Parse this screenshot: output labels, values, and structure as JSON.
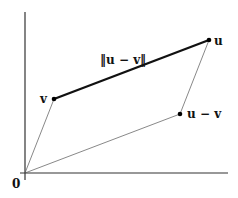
{
  "diagram": {
    "colors": {
      "axis": "#333333",
      "thin_line": "#555555",
      "thick_line": "#111111",
      "point": "#000000"
    },
    "axes": {
      "origin_label": "0"
    },
    "points": [
      {
        "id": "origin",
        "label": "0"
      },
      {
        "id": "u",
        "label": "u"
      },
      {
        "id": "v",
        "label": "v"
      },
      {
        "id": "u_minus_v",
        "label": "u − v"
      }
    ],
    "segments": [
      {
        "from": "origin",
        "to": "v",
        "style": "thin"
      },
      {
        "from": "origin",
        "to": "u_minus_v",
        "style": "thin"
      },
      {
        "from": "u_minus_v",
        "to": "u",
        "style": "thin"
      },
      {
        "from": "v",
        "to": "u",
        "style": "thick",
        "label": "‖u − v‖"
      }
    ],
    "labels": {
      "u": "u",
      "v": "v",
      "u_minus_v": "u − v",
      "norm": "‖u − v‖",
      "origin": "0"
    }
  }
}
